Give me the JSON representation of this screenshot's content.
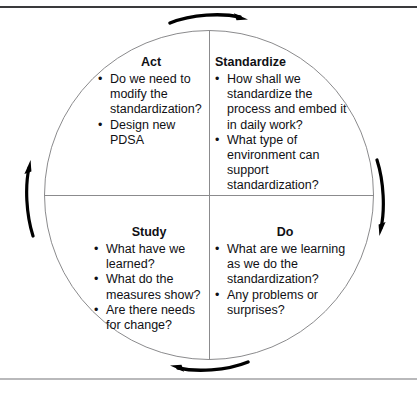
{
  "diagram": {
    "type": "sdsa-cycle-wheel",
    "bullet_glyph": "•",
    "colors": {
      "text": "#101014",
      "circle_line": "#8b8b8d",
      "arrow": "#000000",
      "frame_top": "#3a3a3c",
      "frame_bottom": "#b9b9bb"
    },
    "rotation_direction": "clockwise",
    "quadrants": [
      {
        "id": "act",
        "position": "top-left",
        "title": "Act",
        "title_align": "center",
        "items": [
          "Do we need to modify the standardization?",
          "Design new PDSA"
        ]
      },
      {
        "id": "standardize",
        "position": "top-right",
        "title": "Standardize",
        "title_align": "left",
        "items": [
          "How shall we standardize the process and embed it in daily work?",
          "What type of environment can support standardization?"
        ]
      },
      {
        "id": "study",
        "position": "bottom-left",
        "title": "Study",
        "title_align": "center",
        "items": [
          "What have we learned?",
          "What do the measures show?",
          "Are there needs for change?"
        ]
      },
      {
        "id": "do",
        "position": "bottom-right",
        "title": "Do",
        "title_align": "center",
        "items": [
          "What are we learning as we do the standardization?",
          "Any problems or surprises?"
        ]
      }
    ],
    "arrows": [
      {
        "id": "top",
        "direction": "right"
      },
      {
        "id": "right",
        "direction": "down"
      },
      {
        "id": "bottom",
        "direction": "left"
      },
      {
        "id": "left",
        "direction": "up"
      }
    ]
  }
}
